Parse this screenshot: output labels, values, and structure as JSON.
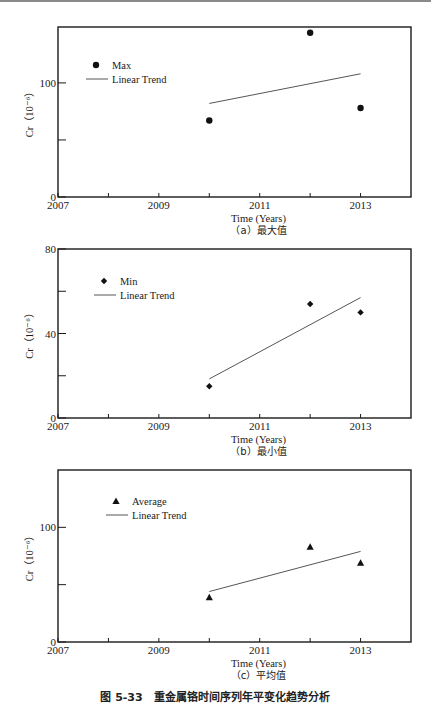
{
  "figure_caption": "图 5-33　重金属铬时间序列年平变化趋势分析",
  "chart_data": [
    {
      "type": "scatter",
      "panel": "a",
      "caption": "（a）最大值",
      "xlabel": "Time (Years)",
      "ylabel": "Cr（10⁻⁶）",
      "xlim": [
        2007,
        2014
      ],
      "ylim": [
        0,
        149
      ],
      "xticks": [
        2007,
        2008,
        2009,
        2010,
        2011,
        2012,
        2013
      ],
      "xtick_labels": [
        "2007",
        "2009",
        "2011",
        "2013"
      ],
      "yticks": [
        0,
        50,
        100
      ],
      "ytick_labels": [
        "0",
        "100"
      ],
      "legend": [
        "Max",
        "Linear Trend"
      ],
      "marker": "circle",
      "series": [
        {
          "name": "Max",
          "x": [
            2010,
            2012,
            2013
          ],
          "values": [
            67,
            144,
            78
          ]
        },
        {
          "name": "Linear Trend",
          "x": [
            2010,
            2013
          ],
          "values": [
            82,
            108
          ]
        }
      ]
    },
    {
      "type": "scatter",
      "panel": "b",
      "caption": "（b）最小值",
      "xlabel": "Time (Years)",
      "ylabel": "Cr（10⁻⁶）",
      "xlim": [
        2007,
        2014
      ],
      "ylim": [
        0,
        80
      ],
      "xticks": [
        2007,
        2008,
        2009,
        2010,
        2011,
        2012,
        2013
      ],
      "xtick_labels": [
        "2007",
        "2009",
        "2011",
        "2013"
      ],
      "yticks": [
        0,
        20,
        40,
        60,
        80
      ],
      "ytick_labels": [
        "0",
        "40",
        "80"
      ],
      "legend": [
        "Min",
        "Linear Trend"
      ],
      "marker": "diamond",
      "series": [
        {
          "name": "Min",
          "x": [
            2010,
            2012,
            2013
          ],
          "values": [
            15,
            54,
            50
          ]
        },
        {
          "name": "Linear Trend",
          "x": [
            2010,
            2013
          ],
          "values": [
            18.5,
            57
          ]
        }
      ]
    },
    {
      "type": "scatter",
      "panel": "c",
      "caption": "（c）平均值",
      "xlabel": "Time (Years)",
      "ylabel": "Cr（10⁻⁶）",
      "xlim": [
        2007,
        2014
      ],
      "ylim": [
        0,
        150
      ],
      "xticks": [
        2007,
        2008,
        2009,
        2010,
        2011,
        2012,
        2013
      ],
      "xtick_labels": [
        "2007",
        "2009",
        "2011",
        "2013"
      ],
      "yticks": [
        0,
        50,
        100
      ],
      "ytick_labels": [
        "0",
        "100"
      ],
      "legend": [
        "Average",
        "Linear Trend"
      ],
      "marker": "triangle",
      "series": [
        {
          "name": "Average",
          "x": [
            2010,
            2012,
            2013
          ],
          "values": [
            39,
            83,
            69
          ]
        },
        {
          "name": "Linear Trend",
          "x": [
            2010,
            2013
          ],
          "values": [
            44,
            79
          ]
        }
      ]
    }
  ],
  "layout": {
    "panels": [
      {
        "left": 58,
        "right": 411,
        "top": 27,
        "bottom": 197,
        "legend_x": 88,
        "legend_y": 69
      },
      {
        "left": 58,
        "right": 411,
        "top": 249,
        "bottom": 418,
        "legend_x": 96,
        "legend_y": 285
      },
      {
        "left": 58,
        "right": 411,
        "top": 470,
        "bottom": 642,
        "legend_x": 108,
        "legend_y": 505
      }
    ],
    "colors": {
      "axis": "#1a1a1a",
      "marker": "#111111",
      "trend": "#555555"
    }
  }
}
